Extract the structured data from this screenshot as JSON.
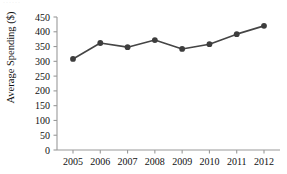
{
  "chart_data": {
    "type": "line",
    "title": "",
    "xlabel": "",
    "ylabel": "Average Spending ($)",
    "categories": [
      "2005",
      "2006",
      "2007",
      "2008",
      "2009",
      "2010",
      "2011",
      "2012"
    ],
    "x": [
      2005,
      2006,
      2007,
      2008,
      2009,
      2010,
      2011,
      2012
    ],
    "values": [
      308,
      362,
      348,
      372,
      342,
      358,
      392,
      420
    ],
    "series": [
      {
        "name": "Average Spending",
        "values": [
          308,
          362,
          348,
          372,
          342,
          358,
          392,
          420
        ]
      }
    ],
    "ylim": [
      0,
      450
    ],
    "yticks": [
      0,
      50,
      100,
      150,
      200,
      250,
      300,
      350,
      400,
      450
    ],
    "ytick_labels": [
      "0",
      "50",
      "100",
      "150",
      "200",
      "250",
      "300",
      "350",
      "400",
      "450"
    ],
    "xtick_labels": [
      "2005",
      "2006",
      "2007",
      "2008",
      "2009",
      "2010",
      "2011",
      "2012"
    ],
    "grid": false,
    "legend": "none",
    "marker": "circle",
    "line_color": "#454545",
    "marker_color": "#3d3d3d",
    "axis_color": "#9a9a9a",
    "text_color": "#111111",
    "background": "#ffffff"
  },
  "artifacts": {
    "top_edge_fragment": "······"
  }
}
